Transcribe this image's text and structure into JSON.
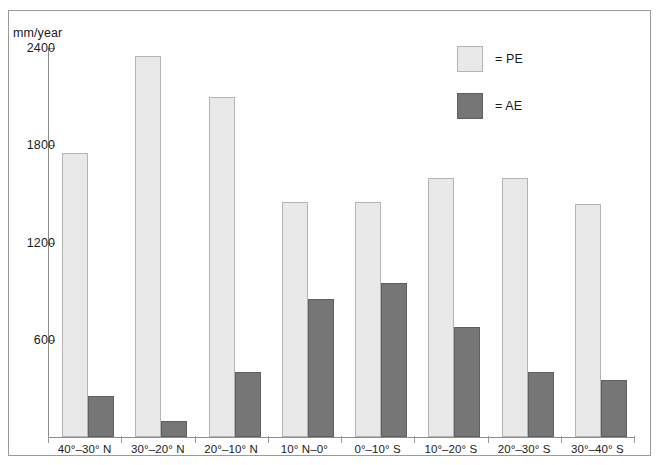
{
  "chart_data": {
    "type": "bar",
    "title": "",
    "xlabel": "",
    "ylabel": "mm/year",
    "ylim": [
      0,
      2400
    ],
    "yticks": [
      600,
      1200,
      1800,
      2400
    ],
    "ytick_labels": [
      "600",
      "1200",
      "1800",
      "2400"
    ],
    "grid": false,
    "legend_position": "top-right",
    "categories": [
      "40°–30° N",
      "30°–20° N",
      "20°–10° N",
      "10° N–0°",
      "0°–10° S",
      "10°–20° S",
      "20°–30° S",
      "30°–40° S"
    ],
    "series": [
      {
        "name": "PE",
        "legend_label": "= PE",
        "color": "#e9e9e9",
        "border_color": "#b4b4b4",
        "values": [
          1750,
          2350,
          2100,
          1450,
          1450,
          1600,
          1600,
          1440
        ]
      },
      {
        "name": "AE",
        "legend_label": "= AE",
        "color": "#767676",
        "border_color": "#5f5f5f",
        "values": [
          255,
          100,
          400,
          850,
          950,
          680,
          400,
          350
        ]
      }
    ]
  },
  "axis": {
    "unit_label": "mm/year"
  },
  "legend": {
    "items": [
      {
        "label": "= PE",
        "swatch": "pe"
      },
      {
        "label": "= AE",
        "swatch": "ae"
      }
    ]
  }
}
